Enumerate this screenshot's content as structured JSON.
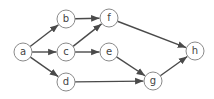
{
  "diagram": {
    "type": "directed-graph",
    "nodes": [
      {
        "id": "a",
        "label": "a",
        "x": 23,
        "y": 52
      },
      {
        "id": "b",
        "label": "b",
        "x": 66,
        "y": 19
      },
      {
        "id": "c",
        "label": "c",
        "x": 66,
        "y": 52
      },
      {
        "id": "d",
        "label": "d",
        "x": 66,
        "y": 82
      },
      {
        "id": "f",
        "label": "f",
        "x": 109,
        "y": 18
      },
      {
        "id": "e",
        "label": "e",
        "x": 109,
        "y": 52
      },
      {
        "id": "g",
        "label": "g",
        "x": 153,
        "y": 81
      },
      {
        "id": "h",
        "label": "h",
        "x": 195,
        "y": 51
      }
    ],
    "edges": [
      {
        "from": "a",
        "to": "b"
      },
      {
        "from": "a",
        "to": "c"
      },
      {
        "from": "a",
        "to": "d"
      },
      {
        "from": "b",
        "to": "f"
      },
      {
        "from": "c",
        "to": "f"
      },
      {
        "from": "c",
        "to": "e"
      },
      {
        "from": "f",
        "to": "h"
      },
      {
        "from": "e",
        "to": "g"
      },
      {
        "from": "d",
        "to": "g"
      },
      {
        "from": "g",
        "to": "h"
      }
    ],
    "node_radius": 9,
    "colors": {
      "edge": "#4a4a4a",
      "node_stroke": "#8a8a8a",
      "node_fill": "#ffffff",
      "label": "#444444"
    }
  }
}
